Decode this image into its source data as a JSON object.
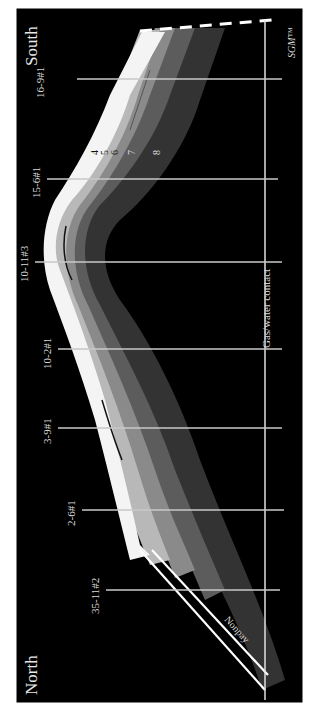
{
  "diagram": {
    "type": "geologic-cross-section",
    "orientation": "rotated 90 degrees clockwise",
    "directions": {
      "left_end": "North",
      "right_end": "South"
    },
    "watermark": "SGM™",
    "wells": [
      {
        "name": "16-9#1"
      },
      {
        "name": "15-6#1"
      },
      {
        "name": "10-11#3"
      },
      {
        "name": "10-2#1"
      },
      {
        "name": "3-9#1"
      },
      {
        "name": "2-6#1"
      },
      {
        "name": "35-11#2"
      }
    ],
    "layers": [
      "4",
      "5",
      "6",
      "7",
      "8"
    ],
    "contact_label": "Gas/water contact",
    "unit_label": "Nonpay",
    "colors": {
      "background": "#000000",
      "frame_border": "#ffffff",
      "band_white": "#f4f4f4",
      "band_light": "#b8b8b8",
      "band_mid": "#8a8a8a",
      "band_dark": "#5c5c5c",
      "band_darkest": "#333333",
      "well_line": "#c8c8c8",
      "contact_line": "#e0e0e0"
    }
  }
}
